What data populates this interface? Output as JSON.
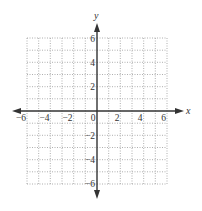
{
  "diagram": {
    "type": "coordinate-plane",
    "x_axis": {
      "label": "x",
      "min": -6,
      "max": 6,
      "tick_labels": [
        "−6",
        "−4",
        "−2",
        "0",
        "2",
        "4",
        "6"
      ],
      "tick_values": [
        -6,
        -4,
        -2,
        0,
        2,
        4,
        6
      ]
    },
    "y_axis": {
      "label": "y",
      "min": -6,
      "max": 6,
      "tick_labels": [
        "6",
        "4",
        "2",
        "−2",
        "−4",
        "−6"
      ],
      "tick_values": [
        6,
        4,
        2,
        -2,
        -4,
        -6
      ]
    },
    "grid": {
      "spacing": 1,
      "style": "dotted",
      "color": "#9a9a9a"
    },
    "axis_color": "#333333"
  },
  "labels": {
    "x": "x",
    "y": "y",
    "xt_m6": "−6",
    "xt_m4": "−4",
    "xt_m2": "−2",
    "xt_0": "0",
    "xt_2": "2",
    "xt_4": "4",
    "xt_6": "6",
    "yt_6": "6",
    "yt_4": "4",
    "yt_2": "2",
    "yt_m2": "−2",
    "yt_m4": "−4",
    "yt_m6": "−6"
  }
}
